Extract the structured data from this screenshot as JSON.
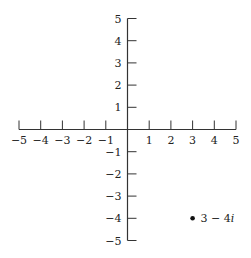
{
  "chart_data": {
    "type": "scatter",
    "title": "",
    "xlabel": "",
    "ylabel": "",
    "xlim": [
      -5,
      5
    ],
    "ylim": [
      -5,
      5
    ],
    "grid": false,
    "x_ticks": [
      -5,
      -4,
      -3,
      -2,
      -1,
      1,
      2,
      3,
      4,
      5
    ],
    "y_ticks": [
      5,
      4,
      3,
      2,
      1,
      -1,
      -2,
      -3,
      -4,
      -5
    ],
    "x_tick_labels": [
      "−5",
      "−4",
      "−3",
      "−2",
      "−1",
      "1",
      "2",
      "3",
      "4",
      "5"
    ],
    "y_tick_labels": [
      "5",
      "4",
      "3",
      "2",
      "1",
      "−1",
      "−2",
      "−3",
      "−4",
      "−5"
    ],
    "series": [
      {
        "name": "complex point",
        "points": [
          {
            "x": 3,
            "y": -4,
            "label": "3 − 4i"
          }
        ]
      }
    ],
    "annotations": [
      {
        "x": 3,
        "y": -4,
        "text": "3 − 4i"
      }
    ]
  },
  "colors": {
    "axis": "#333333",
    "point": "#111111",
    "text": "#222222"
  }
}
